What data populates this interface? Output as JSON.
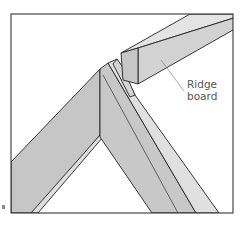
{
  "figure": {
    "callouts": [
      {
        "id": "ridge-board",
        "line1": "Ridge",
        "line2": "board"
      }
    ],
    "colors": {
      "stroke": "#222222",
      "face_dark": "#c4c4c4",
      "face_mid": "#d0d0d0",
      "face_light": "#e2e2e2",
      "background": "#ffffff",
      "leader": "#777777"
    }
  }
}
